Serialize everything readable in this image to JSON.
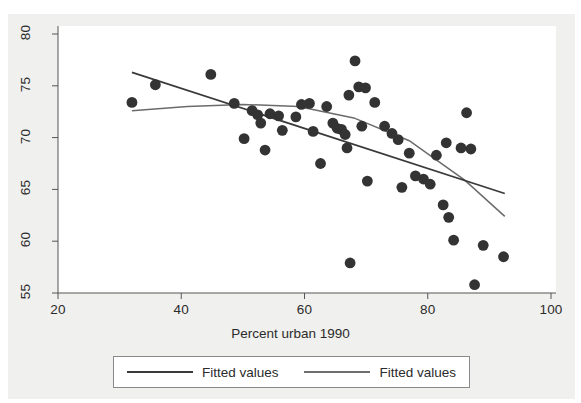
{
  "chart_data": {
    "type": "scatter",
    "title": "",
    "xlabel": "Percent urban 1990",
    "ylabel": "",
    "xlim": [
      20,
      100
    ],
    "ylim": [
      55,
      80
    ],
    "xticks": [
      20,
      40,
      60,
      80,
      100
    ],
    "yticks": [
      55,
      60,
      65,
      70,
      75,
      80
    ],
    "grid": false,
    "marker_color": "#333333",
    "line_color": "#3a3a3a",
    "legend": {
      "position": "below-axis",
      "entries": [
        {
          "label": "Fitted values",
          "style": "solid-dark"
        },
        {
          "label": "Fitted values",
          "style": "solid-light"
        }
      ]
    },
    "points": [
      {
        "x": 32.0,
        "y": 73.4
      },
      {
        "x": 35.8,
        "y": 75.1
      },
      {
        "x": 44.8,
        "y": 76.1
      },
      {
        "x": 48.6,
        "y": 73.3
      },
      {
        "x": 50.2,
        "y": 69.9
      },
      {
        "x": 51.5,
        "y": 72.6
      },
      {
        "x": 52.4,
        "y": 72.2
      },
      {
        "x": 52.9,
        "y": 71.4
      },
      {
        "x": 53.6,
        "y": 68.8
      },
      {
        "x": 54.4,
        "y": 72.3
      },
      {
        "x": 55.8,
        "y": 72.1
      },
      {
        "x": 56.4,
        "y": 70.7
      },
      {
        "x": 58.6,
        "y": 72.0
      },
      {
        "x": 59.5,
        "y": 73.2
      },
      {
        "x": 60.8,
        "y": 73.3
      },
      {
        "x": 61.4,
        "y": 70.6
      },
      {
        "x": 62.6,
        "y": 67.5
      },
      {
        "x": 63.6,
        "y": 73.0
      },
      {
        "x": 64.6,
        "y": 71.4
      },
      {
        "x": 65.3,
        "y": 70.9
      },
      {
        "x": 66.0,
        "y": 70.8
      },
      {
        "x": 66.6,
        "y": 70.3
      },
      {
        "x": 66.9,
        "y": 69.0
      },
      {
        "x": 67.2,
        "y": 74.1
      },
      {
        "x": 67.4,
        "y": 57.9
      },
      {
        "x": 68.2,
        "y": 77.4
      },
      {
        "x": 68.8,
        "y": 74.9
      },
      {
        "x": 69.3,
        "y": 71.1
      },
      {
        "x": 69.9,
        "y": 74.8
      },
      {
        "x": 70.2,
        "y": 65.8
      },
      {
        "x": 71.4,
        "y": 73.4
      },
      {
        "x": 73.0,
        "y": 71.1
      },
      {
        "x": 74.2,
        "y": 70.4
      },
      {
        "x": 75.2,
        "y": 69.8
      },
      {
        "x": 75.8,
        "y": 65.2
      },
      {
        "x": 77.0,
        "y": 68.5
      },
      {
        "x": 78.0,
        "y": 66.3
      },
      {
        "x": 79.3,
        "y": 66.0
      },
      {
        "x": 80.4,
        "y": 65.5
      },
      {
        "x": 81.4,
        "y": 68.3
      },
      {
        "x": 82.5,
        "y": 63.5
      },
      {
        "x": 83.0,
        "y": 69.5
      },
      {
        "x": 83.4,
        "y": 62.3
      },
      {
        "x": 84.2,
        "y": 60.1
      },
      {
        "x": 85.4,
        "y": 69.0
      },
      {
        "x": 86.3,
        "y": 72.4
      },
      {
        "x": 87.0,
        "y": 68.9
      },
      {
        "x": 87.6,
        "y": 55.8
      },
      {
        "x": 89.0,
        "y": 59.6
      },
      {
        "x": 92.3,
        "y": 58.5
      }
    ],
    "fit_linear": {
      "name": "Fitted values",
      "x": [
        32.0,
        92.5
      ],
      "y": [
        76.3,
        64.6
      ]
    },
    "fit_quadratic": {
      "name": "Fitted values",
      "x": [
        32.0,
        41.0,
        50.0,
        59.0,
        68.0,
        77.0,
        86.0,
        92.5
      ],
      "y": [
        72.6,
        73.0,
        73.2,
        73.0,
        71.9,
        69.7,
        65.9,
        62.4
      ]
    }
  }
}
